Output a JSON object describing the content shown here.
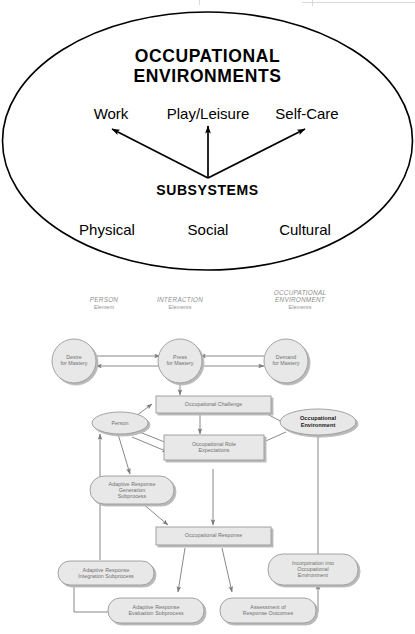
{
  "figure_top": {
    "title_line1": "OCCUPATIONAL",
    "title_line2": "ENVIRONMENTS",
    "subsystems_label": "SUBSYSTEMS",
    "occupations": [
      "Work",
      "Play/Leisure",
      "Self-Care"
    ],
    "subsystems": [
      "Physical",
      "Social",
      "Cultural"
    ],
    "outline_color": "#000000"
  },
  "figure_bottom": {
    "columns": [
      {
        "title": "PERSON",
        "subtitle": "Element"
      },
      {
        "title": "INTERACTION",
        "subtitle": "Elements"
      },
      {
        "title": "OCCUPATIONAL ENVIRONMENT",
        "subtitle": "Elements"
      }
    ],
    "nodes": {
      "desire_for_mastery": "Desire\nfor Mastery",
      "press_for_mastery": "Press\nfor Mastery",
      "demand_for_mastery": "Demand\nfor Mastery",
      "occupational_challenge": "Occupational Challenge",
      "person": "Person",
      "occupational_environment": "Occupational\nEnvironment",
      "occupational_role_expectations": "Occupational Role\nExpectations",
      "adaptive_response_generation": "Adaptive Response\nGeneration\nSubprocess",
      "occupational_response": "Occupational Response",
      "adaptive_response_integration": "Adaptive Response\nIntegration Subprocess",
      "incorporation_into_environment": "Incorporation into\nOccupational\nEnvironment",
      "adaptive_response_evaluation": "Adaptive Response\nEvaluation Subprocess",
      "assessment_of_response_outcomes": "Assessment of\nResponse Outcomes"
    },
    "colors": {
      "shape_fill": "#e8e8e8",
      "shape_stroke": "#9a9a9a",
      "arrow": "#7a7a7a",
      "heading_text": "#8e8e8e",
      "node_text": "#6f6f6f",
      "highlight_text": "#1a1a1a"
    }
  }
}
